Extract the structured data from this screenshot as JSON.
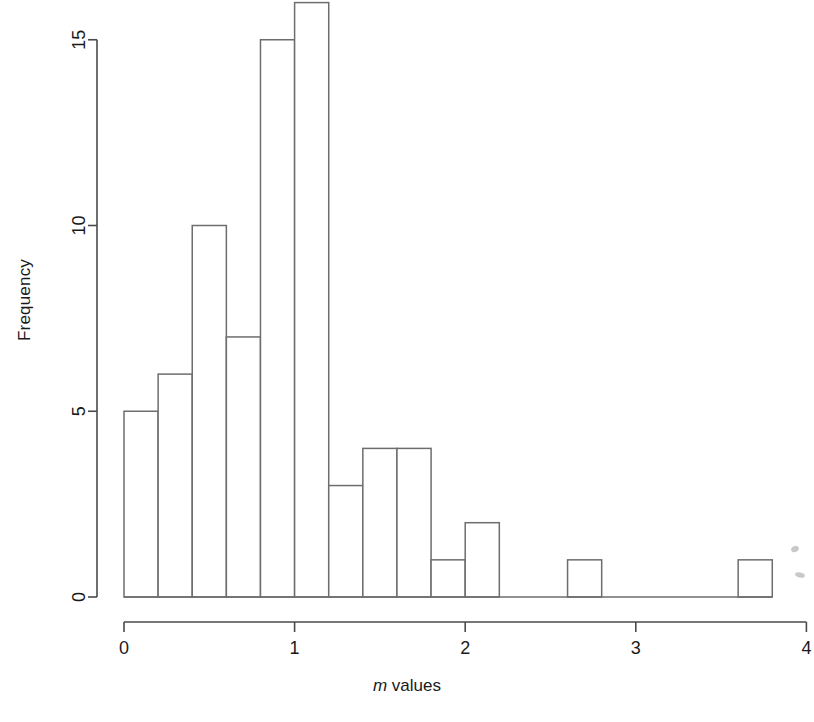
{
  "chart_data": {
    "type": "bar",
    "subtype": "histogram",
    "title": "",
    "subtitle": "",
    "xlabel": "m values",
    "xlabel_italic_part": "m",
    "xlabel_plain_part": " values",
    "ylabel": "Frequency",
    "xlim": [
      0,
      4
    ],
    "ylim": [
      0,
      16
    ],
    "bin_width": 0.2,
    "x_ticks": [
      0,
      1,
      2,
      3,
      4
    ],
    "x_tick_labels": [
      "0",
      "1",
      "2",
      "3",
      "4"
    ],
    "y_ticks": [
      0,
      5,
      10,
      15
    ],
    "y_tick_labels": [
      "0",
      "5",
      "10",
      "15"
    ],
    "grid": false,
    "legend": null,
    "bin_edges": [
      0.0,
      0.2,
      0.4,
      0.6,
      0.8,
      1.0,
      1.2,
      1.4,
      1.6,
      1.8,
      2.0,
      2.2,
      2.4,
      2.6,
      2.8,
      3.0,
      3.2,
      3.4,
      3.6,
      3.8
    ],
    "bin_starts": [
      0.0,
      0.2,
      0.4,
      0.6,
      0.8,
      1.0,
      1.2,
      1.4,
      1.6,
      1.8,
      2.0,
      2.2,
      2.4,
      2.6,
      2.8,
      3.0,
      3.2,
      3.4,
      3.6
    ],
    "categories": [
      "0.0-0.2",
      "0.2-0.4",
      "0.4-0.6",
      "0.6-0.8",
      "0.8-1.0",
      "1.0-1.2",
      "1.2-1.4",
      "1.4-1.6",
      "1.6-1.8",
      "1.8-2.0",
      "2.0-2.2",
      "2.2-2.4",
      "2.4-2.6",
      "2.6-2.8",
      "2.8-3.0",
      "3.0-3.2",
      "3.2-3.4",
      "3.4-3.6",
      "3.6-3.8"
    ],
    "values": [
      5,
      6,
      10,
      7,
      15,
      16,
      3,
      4,
      4,
      1,
      2,
      0,
      0,
      1,
      0,
      0,
      0,
      0,
      1
    ],
    "total_count": 75,
    "bar_fill": "#ffffff",
    "bar_stroke": "#6d6d6d",
    "axis_color": "#4a4a4a",
    "text_color": "#1a1a1a",
    "background": "#ffffff"
  },
  "axes": {
    "y_axis_title": "Frequency",
    "x_axis_title_italic": "m",
    "x_axis_title_rest": " values"
  }
}
